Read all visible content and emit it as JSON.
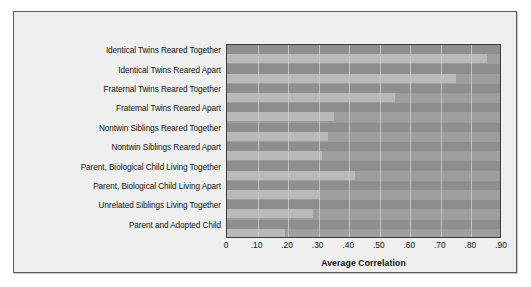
{
  "chart_data": {
    "type": "bar",
    "orientation": "horizontal",
    "title": "",
    "xlabel": "Average Correlation",
    "ylabel": "",
    "xlim": [
      0,
      0.9
    ],
    "grid": true,
    "legend": null,
    "xticks": [
      "0",
      ".10",
      ".20",
      ".30",
      ".40",
      ".50",
      ".60",
      ".70",
      ".80",
      ".90"
    ],
    "xtick_values": [
      0,
      0.1,
      0.2,
      0.3,
      0.4,
      0.5,
      0.6,
      0.7,
      0.8,
      0.9
    ],
    "categories": [
      "Identical Twins Reared Together",
      "Identical Twins Reared Apart",
      "Fraternal Twins Reared Together",
      "Fraternal Twins Reared Apart",
      "Nontwin Siblings Reared Together",
      "Nontwin Siblings Reared Apart",
      "Parent, Biological Child Living Together",
      "Parent, Biological Child Living Apart",
      "Unrelated Siblings Living Together",
      "Parent and Adopted Child"
    ],
    "values": [
      0.85,
      0.75,
      0.55,
      0.35,
      0.33,
      0.31,
      0.42,
      0.3,
      0.28,
      0.19
    ],
    "colors": {
      "bar": "#b9b9b9",
      "band": "#8e8e8e",
      "plot_background": "#9e9e9e",
      "gridline": "#d2d2d2",
      "plot_border": "#3b3b3b",
      "card_background": "#efefef",
      "card_border": "#5a5a5a",
      "text": "#111111"
    }
  }
}
